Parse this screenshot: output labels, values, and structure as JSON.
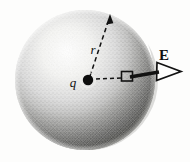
{
  "figure": {
    "background_color": "#fdfdfc",
    "ink_color": "#121212",
    "sphere": {
      "name": "gaussian-sphere",
      "center_x": 85,
      "center_y": 80,
      "radius": 70,
      "shading": "stippled",
      "highlight_color": "#f2f2f0",
      "midtone_color": "#9a9a98",
      "shadow_color": "#3d3d3c"
    },
    "charge": {
      "label": "q",
      "x": 88,
      "y": 81,
      "dot_radius": 5,
      "label_x": 74,
      "label_y": 87
    },
    "radius_vector": {
      "label": "r",
      "from_x": 88,
      "from_y": 81,
      "to_x": 110,
      "to_y": 16,
      "style": "dashed-with-arrowhead",
      "label_x": 92,
      "label_y": 53
    },
    "surface_element": {
      "label": "",
      "x": 122,
      "y": 72,
      "width": 11,
      "height": 9,
      "style": "open-square"
    },
    "connector": {
      "from_x": 95,
      "from_y": 79,
      "to_x": 122,
      "to_y": 78,
      "style": "dashed"
    },
    "field_vector": {
      "label": "E",
      "from_x": 131,
      "from_y": 77,
      "to_x": 180,
      "to_y": 71,
      "style": "solid-thick-open-arrowhead",
      "label_x": 163,
      "label_y": 60
    }
  }
}
